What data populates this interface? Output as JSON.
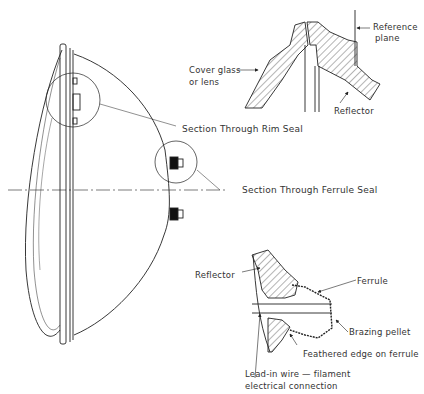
{
  "diagram": {
    "colors": {
      "line": "#222222",
      "hatch": "#444444",
      "background": "#ffffff",
      "text": "#333333"
    },
    "labels": {
      "reference_plane": [
        "Reference",
        "plane"
      ],
      "cover_glass": [
        "Cover glass",
        "or lens"
      ],
      "reflector_top": "Reflector",
      "rim_seal": "Section Through Rim Seal",
      "ferrule_seal": "Section Through Ferrule Seal",
      "reflector_bottom": "Reflector",
      "ferrule": "Ferrule",
      "brazing_pellet": "Brazing pellet",
      "feathered_edge": "Feathered edge on ferrule",
      "lead_in_wire": [
        "Lead-in wire — filament",
        "electrical connection"
      ]
    }
  }
}
